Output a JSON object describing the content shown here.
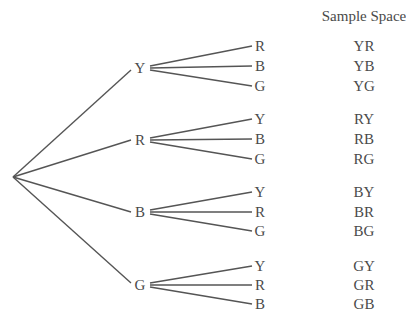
{
  "header": {
    "title": "Sample Space"
  },
  "tree": {
    "root": {
      "x": 13,
      "y": 177
    },
    "branches": [
      {
        "label": "Y",
        "y": 68,
        "children": [
          "R",
          "B",
          "G"
        ],
        "child_y": [
          46,
          66,
          86
        ]
      },
      {
        "label": "R",
        "y": 140,
        "children": [
          "Y",
          "B",
          "G"
        ],
        "child_y": [
          119,
          139,
          159
        ]
      },
      {
        "label": "B",
        "y": 212,
        "children": [
          "Y",
          "R",
          "G"
        ],
        "child_y": [
          192,
          212,
          231
        ]
      },
      {
        "label": "G",
        "y": 285,
        "children": [
          "Y",
          "R",
          "B"
        ],
        "child_y": [
          266,
          285,
          304
        ]
      }
    ]
  },
  "sample_space": [
    "YR",
    "YB",
    "YG",
    "RY",
    "RB",
    "RG",
    "BY",
    "BR",
    "BG",
    "GY",
    "GR",
    "GB"
  ],
  "colors": {
    "line": "#555555",
    "text": "#4a4a4a"
  }
}
